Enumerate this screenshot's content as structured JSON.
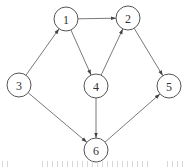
{
  "diagram": {
    "type": "directed-graph",
    "nodes": [
      {
        "id": "1",
        "label": "1",
        "x": 66,
        "y": 19
      },
      {
        "id": "2",
        "label": "2",
        "x": 128,
        "y": 18
      },
      {
        "id": "3",
        "label": "3",
        "x": 19,
        "y": 85
      },
      {
        "id": "4",
        "label": "4",
        "x": 96,
        "y": 86
      },
      {
        "id": "5",
        "label": "5",
        "x": 169,
        "y": 86
      },
      {
        "id": "6",
        "label": "6",
        "x": 96,
        "y": 150
      }
    ],
    "node_radius": 12,
    "edges": [
      {
        "from": "1",
        "to": "2"
      },
      {
        "from": "3",
        "to": "1"
      },
      {
        "from": "1",
        "to": "4"
      },
      {
        "from": "4",
        "to": "2"
      },
      {
        "from": "2",
        "to": "5"
      },
      {
        "from": "4",
        "to": "6"
      },
      {
        "from": "3",
        "to": "6"
      },
      {
        "from": "6",
        "to": "5"
      }
    ],
    "colors": {
      "edge": "#6a6a6a",
      "node_stroke": "#555555",
      "label": "#333333"
    }
  },
  "caption": {
    "visible": "partial (truncated at bottom edge, text not legible)"
  }
}
